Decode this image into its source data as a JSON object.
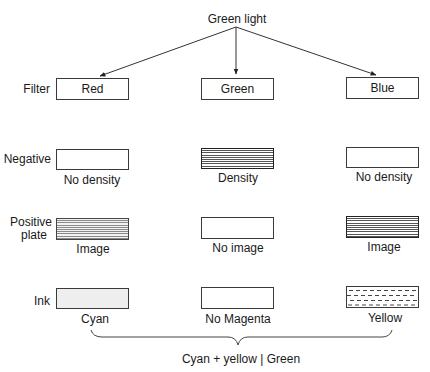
{
  "title": "Green light",
  "rows": {
    "filter": "Filter",
    "negative": "Negative",
    "positive": "Positive\nplate",
    "positive_line1": "Positive",
    "positive_line2": "plate",
    "ink": "Ink"
  },
  "columns": [
    {
      "filter": "Red",
      "negative_caption": "No density",
      "negative_fill": "clear",
      "positive_caption": "Image",
      "positive_fill": "lines",
      "ink_caption": "Cyan",
      "ink_fill": "dots"
    },
    {
      "filter": "Green",
      "negative_caption": "Density",
      "negative_fill": "lines",
      "positive_caption": "No image",
      "positive_fill": "clear",
      "ink_caption": "No Magenta",
      "ink_fill": "clear"
    },
    {
      "filter": "Blue",
      "negative_caption": "No density",
      "negative_fill": "clear",
      "positive_caption": "Image",
      "positive_fill": "lines",
      "ink_caption": "Yellow",
      "ink_fill": "dashes"
    }
  ],
  "result": "Cyan + yellow | Green",
  "colors": {
    "line": "#3a3a3a",
    "background": "#ffffff"
  }
}
